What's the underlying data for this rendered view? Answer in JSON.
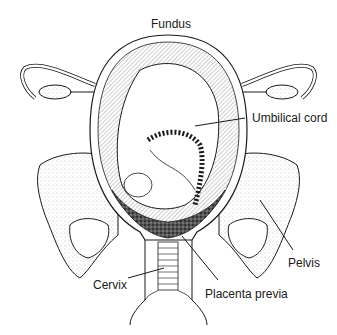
{
  "diagram": {
    "labels": {
      "fundus": "Fundus",
      "umbilical_cord": "Umbilical cord",
      "pelvis": "Pelvis",
      "cervix": "Cervix",
      "placenta_previa": "Placenta previa"
    },
    "colors": {
      "line": "#1a1a1a",
      "stipple": "#9a9a9a",
      "placenta": "#3a3a3a",
      "background": "#ffffff"
    }
  }
}
